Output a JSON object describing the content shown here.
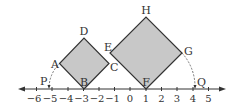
{
  "diagram": {
    "type": "number-line-geometry",
    "number_line": {
      "min_tick": -6,
      "max_tick": 5,
      "tick_labels": [
        "−6",
        "−5",
        "−4",
        "−3",
        "−2",
        "−1",
        "0",
        "1",
        "2",
        "3",
        "4",
        "5"
      ]
    },
    "squares": [
      {
        "name": "ABCD",
        "vertices": {
          "A": "A",
          "B": "B",
          "C": "C",
          "D": "D"
        },
        "bottom_vertex_at": -3,
        "fill": "#c8c8c8"
      },
      {
        "name": "EFGH",
        "vertices": {
          "E": "E",
          "F": "F",
          "G": "G",
          "H": "H"
        },
        "bottom_vertex_at": 1,
        "fill": "#c8c8c8"
      }
    ],
    "points": {
      "P": "P",
      "Q": "Q"
    },
    "colors": {
      "stroke": "#333333",
      "fill": "#c8c8c8",
      "arc": "#555555"
    }
  }
}
